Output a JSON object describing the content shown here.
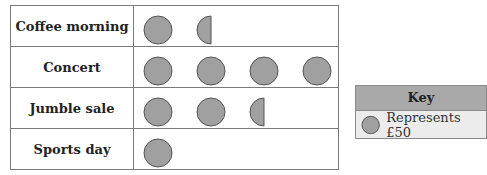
{
  "chart_data": {
    "type": "pictogram",
    "categories": [
      "Coffee morning",
      "Concert",
      "Jumble sale",
      "Sports day"
    ],
    "symbols": [
      1.5,
      4,
      2.5,
      1
    ],
    "values": [
      75,
      200,
      125,
      50
    ],
    "unit_value": 50,
    "key": {
      "title": "Key",
      "text": "Represents £50"
    },
    "symbol_color": "#a0a0a0"
  }
}
